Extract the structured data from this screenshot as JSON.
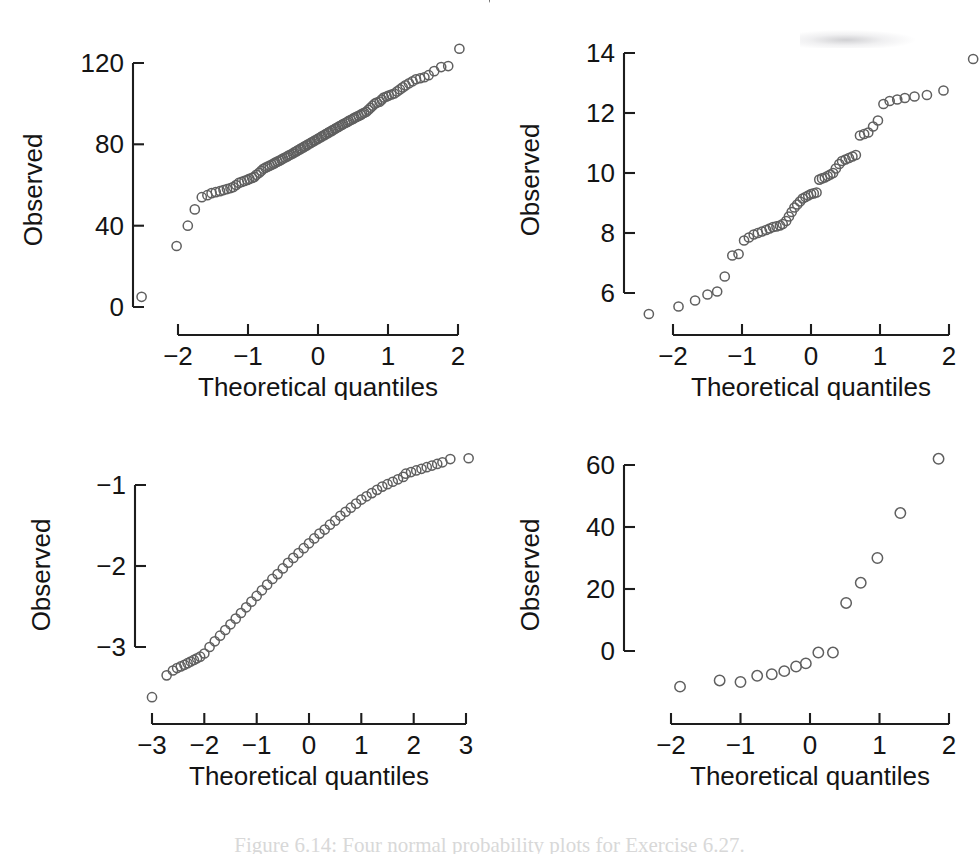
{
  "figure": {
    "caption": "Figure 6.14: Four normal probability plots for Exercise 6.27.",
    "background_color": "#ffffff",
    "point_color": "#5f5f5f",
    "axis_color": "#1d1d1d"
  },
  "panels": [
    {
      "id": "top-left",
      "ylabel": "Observed",
      "xlabel": "Theoretical quantiles"
    },
    {
      "id": "top-right",
      "ylabel": "Observed",
      "xlabel": "Theoretical quantiles"
    },
    {
      "id": "bottom-left",
      "ylabel": "Observed",
      "xlabel": "Theoretical quantiles"
    },
    {
      "id": "bottom-right",
      "ylabel": "Observed",
      "xlabel": "Theoretical quantiles"
    }
  ],
  "chart_data": [
    {
      "id": "top-left",
      "type": "scatter",
      "title": "",
      "xlabel": "Theoretical quantiles",
      "ylabel": "Observed",
      "xticks": [
        -2,
        -1,
        0,
        1,
        2
      ],
      "yticks": [
        0,
        40,
        80,
        120
      ],
      "xlim": [
        -2.75,
        2.75
      ],
      "ylim": [
        -2,
        132
      ],
      "grid": false,
      "legend": null,
      "x": [
        -2.52,
        -2.02,
        -1.86,
        -1.76,
        -1.66,
        -1.58,
        -1.52,
        -1.46,
        -1.4,
        -1.35,
        -1.3,
        -1.25,
        -1.21,
        -1.17,
        -1.13,
        -1.09,
        -1.05,
        -1.01,
        -0.98,
        -0.94,
        -0.91,
        -0.88,
        -0.84,
        -0.81,
        -0.78,
        -0.75,
        -0.72,
        -0.69,
        -0.66,
        -0.63,
        -0.61,
        -0.58,
        -0.55,
        -0.52,
        -0.5,
        -0.47,
        -0.44,
        -0.42,
        -0.39,
        -0.36,
        -0.34,
        -0.31,
        -0.29,
        -0.26,
        -0.24,
        -0.21,
        -0.19,
        -0.16,
        -0.14,
        -0.11,
        -0.09,
        -0.06,
        -0.04,
        -0.01,
        0.01,
        0.04,
        0.06,
        0.09,
        0.11,
        0.14,
        0.16,
        0.19,
        0.21,
        0.24,
        0.26,
        0.29,
        0.31,
        0.34,
        0.36,
        0.39,
        0.42,
        0.44,
        0.47,
        0.5,
        0.52,
        0.55,
        0.58,
        0.61,
        0.63,
        0.66,
        0.69,
        0.72,
        0.75,
        0.78,
        0.81,
        0.84,
        0.88,
        0.91,
        0.94,
        0.98,
        1.01,
        1.05,
        1.09,
        1.13,
        1.17,
        1.21,
        1.25,
        1.3,
        1.35,
        1.4,
        1.46,
        1.52,
        1.58,
        1.66,
        1.76,
        1.86,
        2.02,
        2.52
      ],
      "y": [
        5,
        30,
        40,
        48,
        54,
        55,
        56,
        56.5,
        57,
        57.5,
        58,
        58.5,
        59,
        60,
        61,
        61.5,
        62,
        62.5,
        63,
        63.5,
        64,
        65,
        66,
        67,
        68,
        68.5,
        69,
        69.5,
        70,
        70.5,
        71,
        71.5,
        72,
        72.5,
        73,
        73.5,
        74,
        74.5,
        75,
        75.5,
        76,
        76.5,
        77,
        77.5,
        78,
        78.5,
        79,
        79.5,
        80,
        80.5,
        81,
        81.5,
        82,
        82.5,
        83,
        83.5,
        84,
        84.5,
        85,
        85.5,
        86,
        86.5,
        87,
        87.5,
        88,
        88.5,
        89,
        89.5,
        90,
        90.5,
        91,
        91.5,
        92,
        92.5,
        93,
        93.5,
        94,
        94.5,
        95,
        95.5,
        96,
        97,
        98,
        99,
        100,
        100.5,
        101,
        102,
        103,
        103.5,
        104,
        104.5,
        105,
        106,
        107,
        108,
        109,
        110,
        111,
        112,
        112.5,
        113,
        114,
        116,
        118,
        118.5,
        127
      ]
    },
    {
      "id": "top-right",
      "type": "scatter",
      "title": "",
      "xlabel": "Theoretical quantiles",
      "ylabel": "Observed",
      "xticks": [
        -2,
        -1,
        0,
        1,
        2
      ],
      "yticks": [
        6,
        8,
        10,
        12,
        14
      ],
      "xlim": [
        -2.45,
        2.45
      ],
      "ylim": [
        5.0,
        14.3
      ],
      "grid": false,
      "legend": null,
      "x": [
        -2.35,
        -1.92,
        -1.68,
        -1.5,
        -1.36,
        -1.25,
        -1.14,
        -1.05,
        -0.97,
        -0.9,
        -0.83,
        -0.77,
        -0.71,
        -0.65,
        -0.6,
        -0.55,
        -0.5,
        -0.45,
        -0.41,
        -0.36,
        -0.32,
        -0.28,
        -0.24,
        -0.2,
        -0.16,
        -0.12,
        -0.08,
        -0.04,
        0.0,
        0.04,
        0.08,
        0.12,
        0.16,
        0.2,
        0.24,
        0.28,
        0.32,
        0.36,
        0.41,
        0.45,
        0.5,
        0.55,
        0.6,
        0.65,
        0.71,
        0.77,
        0.83,
        0.9,
        0.97,
        1.05,
        1.14,
        1.25,
        1.36,
        1.5,
        1.68,
        1.92,
        2.35
      ],
      "y": [
        5.3,
        5.55,
        5.75,
        5.95,
        6.05,
        6.55,
        7.25,
        7.3,
        7.75,
        7.85,
        7.95,
        8.0,
        8.05,
        8.1,
        8.15,
        8.2,
        8.22,
        8.25,
        8.3,
        8.4,
        8.55,
        8.7,
        8.85,
        8.95,
        9.05,
        9.15,
        9.2,
        9.25,
        9.3,
        9.32,
        9.35,
        9.78,
        9.82,
        9.85,
        9.9,
        9.95,
        10.0,
        10.15,
        10.3,
        10.4,
        10.45,
        10.5,
        10.55,
        10.6,
        11.25,
        11.3,
        11.35,
        11.55,
        11.75,
        12.3,
        12.4,
        12.45,
        12.5,
        12.55,
        12.6,
        12.75,
        13.8
      ]
    },
    {
      "id": "bottom-left",
      "type": "scatter",
      "title": "",
      "xlabel": "Theoretical quantiles",
      "ylabel": "Observed",
      "xticks": [
        -3,
        -2,
        -1,
        0,
        1,
        2,
        3
      ],
      "yticks": [
        -3,
        -2,
        -1
      ],
      "xlim": [
        -3.3,
        3.3
      ],
      "ylim": [
        -3.75,
        -0.5
      ],
      "grid": false,
      "legend": null,
      "x": [
        -3.0,
        -2.72,
        -2.6,
        -2.52,
        -2.45,
        -2.38,
        -2.32,
        -2.26,
        -2.2,
        -2.14,
        -2.08,
        -2.0,
        -1.9,
        -1.8,
        -1.7,
        -1.6,
        -1.5,
        -1.4,
        -1.3,
        -1.2,
        -1.1,
        -1.0,
        -0.9,
        -0.8,
        -0.7,
        -0.6,
        -0.5,
        -0.4,
        -0.3,
        -0.2,
        -0.1,
        0.0,
        0.1,
        0.2,
        0.3,
        0.4,
        0.5,
        0.6,
        0.7,
        0.8,
        0.9,
        1.0,
        1.1,
        1.2,
        1.3,
        1.4,
        1.5,
        1.6,
        1.7,
        1.8,
        1.85,
        1.95,
        2.05,
        2.15,
        2.25,
        2.35,
        2.45,
        2.55,
        2.7,
        3.05
      ],
      "y": [
        -3.62,
        -3.35,
        -3.29,
        -3.26,
        -3.24,
        -3.22,
        -3.2,
        -3.18,
        -3.16,
        -3.14,
        -3.12,
        -3.08,
        -3.0,
        -2.93,
        -2.86,
        -2.79,
        -2.72,
        -2.65,
        -2.58,
        -2.51,
        -2.44,
        -2.37,
        -2.3,
        -2.23,
        -2.16,
        -2.1,
        -2.03,
        -1.96,
        -1.9,
        -1.84,
        -1.78,
        -1.72,
        -1.66,
        -1.6,
        -1.55,
        -1.49,
        -1.44,
        -1.38,
        -1.33,
        -1.28,
        -1.23,
        -1.18,
        -1.14,
        -1.1,
        -1.06,
        -1.02,
        -0.99,
        -0.96,
        -0.93,
        -0.9,
        -0.86,
        -0.84,
        -0.82,
        -0.8,
        -0.78,
        -0.76,
        -0.74,
        -0.72,
        -0.68,
        -0.67
      ]
    },
    {
      "id": "bottom-right",
      "type": "scatter",
      "title": "",
      "xlabel": "Theoretical quantiles",
      "ylabel": "Observed",
      "xticks": [
        -2,
        -1,
        0,
        1,
        2
      ],
      "yticks": [
        0,
        20,
        40,
        60
      ],
      "xlim": [
        -2.1,
        2.1
      ],
      "ylim": [
        -14,
        66
      ],
      "grid": false,
      "legend": null,
      "x": [
        -1.87,
        -1.3,
        -1.0,
        -0.76,
        -0.55,
        -0.37,
        -0.2,
        -0.06,
        0.12,
        0.33,
        0.52,
        0.73,
        0.97,
        1.3,
        1.85
      ],
      "y": [
        -11.5,
        -9.5,
        -10.0,
        -8.0,
        -7.5,
        -6.5,
        -5.0,
        -4.0,
        -0.5,
        -0.5,
        15.5,
        22.0,
        30.0,
        44.5,
        62.0
      ]
    }
  ]
}
